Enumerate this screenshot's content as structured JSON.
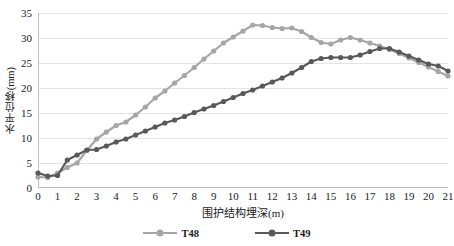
{
  "chart_data": {
    "type": "line",
    "title": "",
    "xlabel": "围护结构埋深(m)",
    "ylabel": "水平位移(mm)",
    "xlim": [
      0,
      21
    ],
    "ylim": [
      0,
      35
    ],
    "grid": true,
    "legend_position": "bottom",
    "x_ticks": [
      0,
      1,
      2,
      3,
      4,
      5,
      6,
      7,
      8,
      9,
      10,
      11,
      12,
      13,
      14,
      15,
      16,
      17,
      18,
      19,
      20,
      21
    ],
    "y_ticks": [
      0,
      5,
      10,
      15,
      20,
      25,
      30,
      35
    ],
    "x": [
      0,
      0.5,
      1,
      1.5,
      2,
      2.5,
      3,
      3.5,
      4,
      4.5,
      5,
      5.5,
      6,
      6.5,
      7,
      7.5,
      8,
      8.5,
      9,
      9.5,
      10,
      10.5,
      11,
      11.5,
      12,
      12.5,
      13,
      13.5,
      14,
      14.5,
      15,
      15.5,
      16,
      16.5,
      17,
      17.5,
      18,
      18.5,
      19,
      19.5,
      20,
      20.5,
      21
    ],
    "series": [
      {
        "name": "T48",
        "color": "#a6a6a6",
        "values": [
          2.2,
          2.1,
          3.0,
          4.1,
          5.0,
          7.5,
          9.8,
          11.2,
          12.5,
          13.2,
          14.6,
          16.2,
          18.0,
          19.4,
          21.0,
          22.5,
          24.1,
          25.8,
          27.4,
          29.0,
          30.2,
          31.4,
          32.6,
          32.5,
          32.1,
          31.9,
          32.0,
          31.3,
          30.1,
          29.1,
          28.8,
          29.6,
          30.1,
          29.6,
          29.0,
          28.4,
          27.7,
          26.9,
          26.0,
          25.1,
          24.2,
          23.3,
          22.4
        ]
      },
      {
        "name": "T49",
        "color": "#595959",
        "values": [
          3.0,
          2.4,
          2.5,
          5.6,
          6.6,
          7.6,
          7.7,
          8.4,
          9.2,
          9.8,
          10.6,
          11.4,
          12.2,
          13.0,
          13.6,
          14.3,
          15.1,
          15.8,
          16.5,
          17.3,
          18.1,
          18.9,
          19.6,
          20.4,
          21.2,
          22.0,
          23.0,
          24.1,
          25.3,
          25.9,
          26.1,
          26.1,
          26.1,
          26.6,
          27.3,
          27.9,
          27.9,
          27.2,
          26.4,
          25.6,
          24.8,
          24.4,
          23.4
        ]
      }
    ]
  },
  "legend": {
    "items": [
      {
        "label": "T48",
        "color": "#a6a6a6"
      },
      {
        "label": "T49",
        "color": "#595959"
      }
    ]
  }
}
